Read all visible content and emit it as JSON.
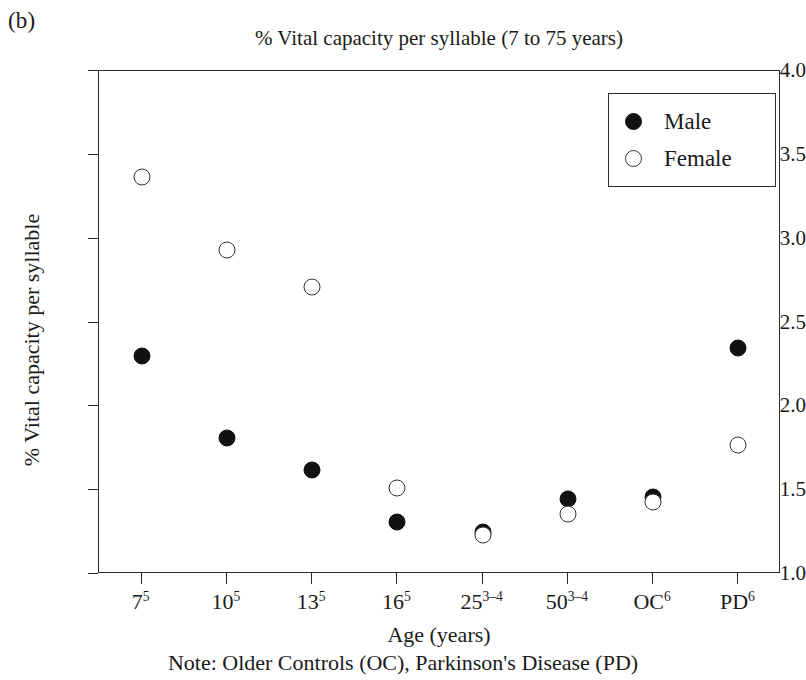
{
  "panel_label": "(b)",
  "chart_data": {
    "type": "scatter",
    "title": "% Vital capacity per syllable (7 to 75 years)",
    "xlabel": "Age (years)",
    "ylabel": "% Vital capacity per syllable",
    "note": "Note: Older Controls (OC), Parkinson's Disease (PD)",
    "categories": [
      "7",
      "10",
      "13",
      "16",
      "25",
      "50",
      "OC",
      "PD"
    ],
    "category_superscripts": [
      "5",
      "5",
      "5",
      "5",
      "3–4",
      "3–4",
      "6",
      "6"
    ],
    "tick_labels": [
      "7⁵",
      "10⁵",
      "13⁵",
      "16⁵",
      "25³⁻⁴",
      "50³⁻⁴",
      "OC⁶",
      "PD⁶"
    ],
    "ylim": [
      1.0,
      4.0
    ],
    "y_ticks": [
      1.0,
      1.5,
      2.0,
      2.5,
      3.0,
      3.5,
      4.0
    ],
    "y_tick_labels": [
      "1.0",
      "1.5",
      "2.0",
      "2.5",
      "3.0",
      "3.5",
      "4.0"
    ],
    "grid": false,
    "legend_position": "top-right",
    "series": [
      {
        "name": "Male",
        "marker": "filled-circle",
        "color": "#111111",
        "values": [
          2.3,
          1.81,
          1.62,
          1.31,
          1.25,
          1.45,
          1.46,
          2.35
        ]
      },
      {
        "name": "Female",
        "marker": "open-circle",
        "color": "#ffffff",
        "values": [
          3.37,
          2.93,
          2.71,
          1.51,
          1.23,
          1.36,
          1.43,
          1.77
        ]
      }
    ]
  },
  "legend": {
    "entries": [
      {
        "label": "Male",
        "marker": "filled-circle"
      },
      {
        "label": "Female",
        "marker": "open-circle"
      }
    ]
  }
}
